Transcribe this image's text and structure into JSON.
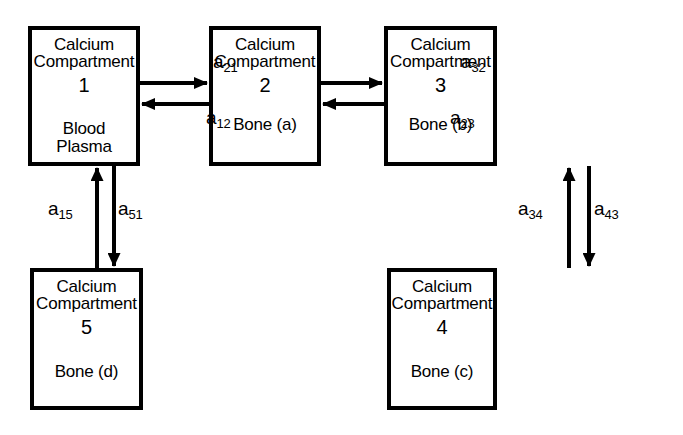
{
  "diagram": {
    "background_color": "#ffffff",
    "stroke_color": "#000000",
    "nodes": [
      {
        "id": "compartment-1",
        "title": "Calcium\nCompartment",
        "number": "1",
        "subtitle": "Blood\nPlasma",
        "x": 28,
        "y": 26,
        "w": 112,
        "h": 140
      },
      {
        "id": "compartment-2",
        "title": "Calcium\nCompartment",
        "number": "2",
        "subtitle": "Bone  (a)",
        "x": 209,
        "y": 26,
        "w": 112,
        "h": 140
      },
      {
        "id": "compartment-3",
        "title": "Calcium\nCompartment",
        "number": "3",
        "subtitle": "Bone  (b)",
        "x": 384,
        "y": 26,
        "w": 113,
        "h": 140
      },
      {
        "id": "compartment-5",
        "title": "Calcium\nCompartment",
        "number": "5",
        "subtitle": "Bone  (d)",
        "x": 30,
        "y": 268,
        "w": 113,
        "h": 142
      },
      {
        "id": "compartment-4",
        "title": "Calcium\nCompartment",
        "number": "4",
        "subtitle": "Bone  (c)",
        "x": 387,
        "y": 268,
        "w": 110,
        "h": 142
      }
    ],
    "edges": [
      {
        "id": "edge-a21",
        "base": "a",
        "sub": "21",
        "from": "compartment-1",
        "to": "compartment-2",
        "direction": "right",
        "label_x": 213,
        "label_y": 51
      },
      {
        "id": "edge-a12",
        "base": "a",
        "sub": "12",
        "from": "compartment-2",
        "to": "compartment-1",
        "direction": "left",
        "label_x": 206,
        "label_y": 107
      },
      {
        "id": "edge-a32",
        "base": "a",
        "sub": "32",
        "from": "compartment-2",
        "to": "compartment-3",
        "direction": "right",
        "label_x": 461,
        "label_y": 51
      },
      {
        "id": "edge-a23",
        "base": "a",
        "sub": "23",
        "from": "compartment-3",
        "to": "compartment-2",
        "direction": "left",
        "label_x": 450,
        "label_y": 107
      },
      {
        "id": "edge-a15",
        "base": "a",
        "sub": "15",
        "from": "compartment-5",
        "to": "compartment-1",
        "direction": "up",
        "label_x": 48,
        "label_y": 198
      },
      {
        "id": "edge-a51",
        "base": "a",
        "sub": "51",
        "from": "compartment-1",
        "to": "compartment-5",
        "direction": "down",
        "label_x": 118,
        "label_y": 198
      },
      {
        "id": "edge-a34",
        "base": "a",
        "sub": "34",
        "from": "compartment-4",
        "to": "compartment-3",
        "direction": "up",
        "label_x": 518,
        "label_y": 198
      },
      {
        "id": "edge-a43",
        "base": "a",
        "sub": "43",
        "from": "compartment-3",
        "to": "compartment-4",
        "direction": "down",
        "label_x": 594,
        "label_y": 198
      }
    ]
  }
}
